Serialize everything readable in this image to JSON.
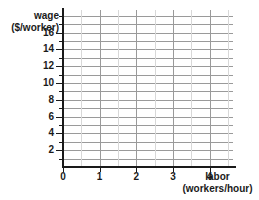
{
  "chart_data": {
    "type": "line",
    "title": "",
    "subtitle": "",
    "xlabel": "labor",
    "xunit": "(workers/hour)",
    "ylabel": "wage",
    "yunit": "($/worker)",
    "xlim": [
      0,
      4.64
    ],
    "ylim": [
      0,
      18.7
    ],
    "x_ticks": [
      0,
      1,
      2,
      3,
      4
    ],
    "x_tick_labels": [
      "0",
      "1",
      "2",
      "3",
      "4"
    ],
    "y_ticks": [
      2,
      4,
      6,
      8,
      10,
      12,
      14,
      16
    ],
    "y_tick_labels": [
      "2",
      "4",
      "6",
      "8",
      "10",
      "12",
      "14",
      "16"
    ],
    "y_minor_ticks": [
      1,
      3,
      5,
      7,
      9,
      11,
      13,
      15,
      17,
      18
    ],
    "grid": true,
    "grid_h_step": 1,
    "grid_v_step": 1,
    "grid_v_minor_step": 0.5,
    "legend": [],
    "series": [],
    "annotations": [],
    "note": "empty plotting grid, no data plotted"
  },
  "axes": {
    "y_title": "wage",
    "y_unit": "($/worker)",
    "x_title": "labor",
    "x_unit": "(workers/hour)"
  },
  "colors": {
    "axis": "#1a1a1a",
    "grid_major": "#9a9a9a",
    "grid_minor": "#d8d8d8",
    "background": "#ffffff",
    "text": "#1a1a1a"
  }
}
